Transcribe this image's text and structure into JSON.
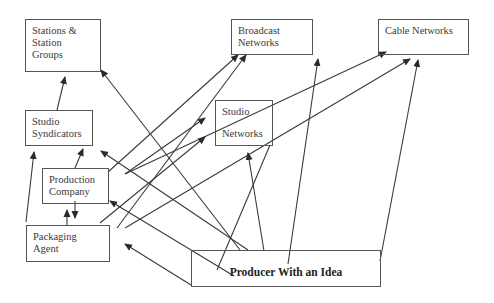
{
  "diagram": {
    "title": "",
    "nodes": [
      {
        "id": "stations",
        "lines": [
          "Stations &",
          "Station Groups"
        ],
        "box": [
          25,
          19,
          76,
          53
        ]
      },
      {
        "id": "broadcast",
        "lines": [
          "Broadcast",
          "Networks"
        ],
        "box": [
          231,
          19,
          82,
          36
        ]
      },
      {
        "id": "cable",
        "lines": [
          "Cable Networks",
          ""
        ],
        "box": [
          378,
          19,
          91,
          36
        ]
      },
      {
        "id": "studio_syndicators",
        "lines": [
          "Studio",
          "Syndicators"
        ],
        "box": [
          25,
          110,
          68,
          36
        ]
      },
      {
        "id": "studio_networks",
        "lines": [
          "Studio",
          "Networks"
        ],
        "box": [
          215,
          100,
          58,
          46
        ]
      },
      {
        "id": "production_company",
        "lines": [
          "Production",
          "Company"
        ],
        "box": [
          42,
          168,
          67,
          36
        ]
      },
      {
        "id": "packaging_agent",
        "lines": [
          "Packaging Agent",
          ""
        ],
        "box": [
          26,
          225,
          84,
          37
        ]
      },
      {
        "id": "producer",
        "lines": [
          "Producer With an Idea",
          ""
        ],
        "box": [
          191,
          250,
          190,
          37
        ]
      }
    ],
    "edges": [
      {
        "from": "studio_syndicators",
        "to": "stations",
        "pts": [
          57,
          110,
          65,
          77
        ]
      },
      {
        "from": "producer",
        "to": "stations",
        "pts": [
          240,
          250,
          101,
          70
        ]
      },
      {
        "from": "production_company",
        "to": "studio_syndicators",
        "pts": [
          75,
          168,
          83,
          149
        ]
      },
      {
        "from": "packaging_agent",
        "to": "studio_syndicators",
        "pts": [
          26,
          222,
          34,
          152
        ]
      },
      {
        "from": "production_company",
        "to": "packaging_agent",
        "pts": [
          75,
          201,
          75,
          218
        ]
      },
      {
        "from": "packaging_agent",
        "to": "production_company",
        "pts": [
          67,
          225,
          67,
          210
        ]
      },
      {
        "from": "production_company",
        "to": "broadcast",
        "pts": [
          108,
          172,
          238,
          55
        ]
      },
      {
        "from": "production_company",
        "to": "studio_networks",
        "pts": [
          125,
          174,
          205,
          118
        ]
      },
      {
        "from": "production_company",
        "to": "cable",
        "pts": [
          125,
          174,
          386,
          52
        ]
      },
      {
        "from": "packaging_agent",
        "to": "broadcast",
        "pts": [
          117,
          228,
          246,
          55
        ]
      },
      {
        "from": "packaging_agent",
        "to": "studio_networks",
        "pts": [
          100,
          223,
          205,
          137
        ]
      },
      {
        "from": "packaging_agent",
        "to": "cable",
        "pts": [
          125,
          228,
          410,
          59
        ]
      },
      {
        "from": "producer",
        "to": "studio_syndicators",
        "pts": [
          248,
          250,
          101,
          151
        ]
      },
      {
        "from": "producer",
        "to": "production_company",
        "pts": [
          234,
          276,
          110,
          201
        ]
      },
      {
        "from": "producer",
        "to": "packaging_agent",
        "pts": [
          191,
          285,
          125,
          244
        ]
      },
      {
        "from": "producer",
        "to": "studio_networks",
        "pts": [
          264,
          251,
          248,
          153
        ]
      },
      {
        "from": "producer",
        "to": "broadcast",
        "pts": [
          288,
          264,
          318,
          59
        ]
      },
      {
        "from": "producer",
        "to": "cable",
        "pts": [
          380,
          261,
          418,
          60
        ]
      },
      {
        "from": "producer_extra",
        "to": "studio_networks",
        "pts": [
          217,
          270,
          270,
          145
        ]
      }
    ],
    "colors": {
      "line": "#3a3a3a",
      "border": "#555555",
      "text": "#3a3a3a"
    }
  }
}
